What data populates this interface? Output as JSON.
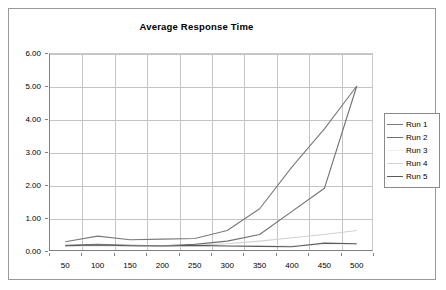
{
  "chart_data": {
    "type": "line",
    "title": "Average Response Time",
    "xlabel": "",
    "ylabel": "",
    "x": [
      50,
      100,
      150,
      200,
      250,
      300,
      350,
      400,
      450,
      500
    ],
    "categories": [
      "50",
      "100",
      "150",
      "200",
      "250",
      "300",
      "350",
      "400",
      "450",
      "500"
    ],
    "xtick_labels": [
      "50",
      "100",
      "150",
      "200",
      "250",
      "300",
      "350",
      "400",
      "450",
      "500"
    ],
    "ytick_labels": [
      "0.00",
      "1.00",
      "2.00",
      "3.00",
      "4.00",
      "5.00",
      "6.00"
    ],
    "ylim": [
      0,
      6
    ],
    "ytick_step": 1,
    "grid": true,
    "legend_position": "right",
    "series": [
      {
        "name": "Run 1",
        "color": "#7a7a7a",
        "values": [
          0.28,
          0.45,
          0.34,
          0.36,
          0.38,
          0.62,
          1.28,
          2.55,
          3.7,
          5.0
        ]
      },
      {
        "name": "Run 2",
        "color": "#707070",
        "values": [
          0.17,
          0.2,
          0.17,
          0.16,
          0.2,
          0.3,
          0.5,
          1.2,
          1.9,
          5.0
        ]
      },
      {
        "name": "Run 3",
        "color": "#f0f0f0",
        "values": [
          0.14,
          0.15,
          0.14,
          0.13,
          0.14,
          0.15,
          0.16,
          0.17,
          0.18,
          0.2
        ]
      },
      {
        "name": "Run 4",
        "color": "#d2d2d2",
        "values": [
          0.15,
          0.17,
          0.16,
          0.15,
          0.17,
          0.22,
          0.3,
          0.4,
          0.5,
          0.62
        ]
      },
      {
        "name": "Run 5",
        "color": "#5a5a5a",
        "values": [
          0.16,
          0.18,
          0.16,
          0.15,
          0.17,
          0.15,
          0.14,
          0.13,
          0.24,
          0.22
        ]
      }
    ]
  },
  "legend": {
    "items": [
      {
        "label": "Run 1"
      },
      {
        "label": "Run 2"
      },
      {
        "label": "Run 3"
      },
      {
        "label": "Run 4"
      },
      {
        "label": "Run 5"
      }
    ]
  }
}
